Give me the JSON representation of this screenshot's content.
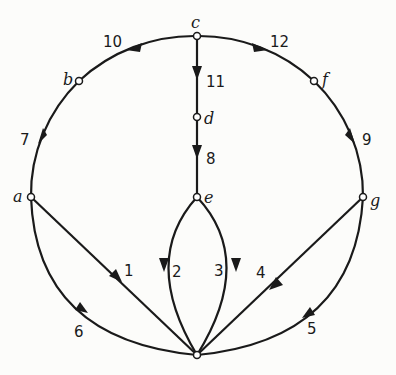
{
  "diagram": {
    "type": "directed-graph",
    "nodes": [
      {
        "id": "c",
        "label": "c"
      },
      {
        "id": "b",
        "label": "b"
      },
      {
        "id": "f",
        "label": "f"
      },
      {
        "id": "d",
        "label": "d"
      },
      {
        "id": "a",
        "label": "a"
      },
      {
        "id": "e",
        "label": "e"
      },
      {
        "id": "g",
        "label": "g"
      },
      {
        "id": "h",
        "label": ""
      }
    ],
    "edges": [
      {
        "label": "1",
        "from": "a",
        "to": "h"
      },
      {
        "label": "2",
        "from": "e",
        "to": "h"
      },
      {
        "label": "3",
        "from": "e",
        "to": "h"
      },
      {
        "label": "4",
        "from": "g",
        "to": "h"
      },
      {
        "label": "5",
        "from": "g",
        "to": "h"
      },
      {
        "label": "6",
        "from": "a",
        "to": "h"
      },
      {
        "label": "7",
        "from": "b",
        "to": "a"
      },
      {
        "label": "8",
        "from": "d",
        "to": "e"
      },
      {
        "label": "9",
        "from": "f",
        "to": "g"
      },
      {
        "label": "10",
        "from": "c",
        "to": "b"
      },
      {
        "label": "11",
        "from": "c",
        "to": "d"
      },
      {
        "label": "12",
        "from": "c",
        "to": "f"
      }
    ]
  }
}
